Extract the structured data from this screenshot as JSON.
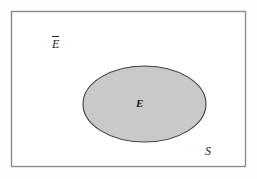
{
  "figure": {
    "kind": "venn-diagram",
    "caption": "",
    "background_color": "#fdfdfd"
  },
  "sample_space": {
    "label": "S",
    "shape": "rectangle",
    "border_color": "#8d8d8d",
    "fill_color": "#ffffff",
    "x": 11,
    "y": 11,
    "width": 234,
    "height": 155,
    "label_x": 205,
    "label_y": 145
  },
  "event": {
    "label": "E",
    "shape": "ellipse",
    "fill_color": "#c9c9c9",
    "border_color": "#3d3d3d",
    "center_x": 144.5,
    "center_y": 104,
    "radius_x": 61.5,
    "radius_y": 38,
    "label_x": 136,
    "label_y": 98
  },
  "complement": {
    "label": "E",
    "notation": "overbar",
    "description": "complement-of-event-E",
    "label_x": 52,
    "label_y": 36
  }
}
